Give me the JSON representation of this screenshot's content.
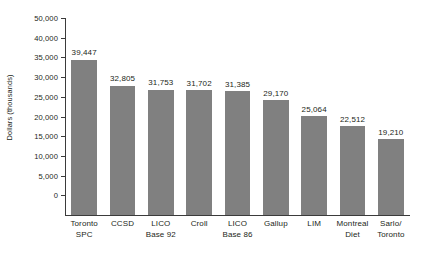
{
  "chart_data": {
    "type": "bar",
    "title": "",
    "subtitle": "",
    "xlabel": "",
    "ylabel": "Dollars (thousands)",
    "ylim": [
      0,
      50000
    ],
    "grid": false,
    "legend": "none",
    "orientation": "vertical",
    "bar_color": "#808080",
    "axis_color": "#3b3b3b",
    "text_color": "#231f20",
    "categories": [
      "Toronto SPC",
      "CCSD",
      "LICO Base 92",
      "Croll",
      "LICO Base 86",
      "Gallup",
      "LIM",
      "Montreal Diet",
      "Sarlo/ Toronto"
    ],
    "category_lines": [
      [
        "Toronto",
        "SPC"
      ],
      [
        "CCSD",
        ""
      ],
      [
        "LICO",
        "Base 92"
      ],
      [
        "Croll",
        ""
      ],
      [
        "LICO",
        "Base 86"
      ],
      [
        "Gallup",
        ""
      ],
      [
        "LIM",
        ""
      ],
      [
        "Montreal",
        "Diet"
      ],
      [
        "Sarlo/",
        "Toronto"
      ]
    ],
    "values": [
      39447,
      32805,
      31753,
      31702,
      31385,
      29170,
      25064,
      22512,
      19210
    ],
    "value_labels": [
      "39,447",
      "32,805",
      "31,753",
      "31,702",
      "31,385",
      "29,170",
      "25,064",
      "22,512",
      "19,210"
    ],
    "ytick_labels": [
      "50,000",
      "40,000",
      "35,000",
      "30,000",
      "25,000",
      "20,000",
      "15,000",
      "10,000",
      "5,000",
      "0"
    ],
    "ytick_positions": [
      50000,
      45000,
      40000,
      35000,
      30000,
      25000,
      20000,
      15000,
      10000,
      5000,
      0
    ]
  }
}
